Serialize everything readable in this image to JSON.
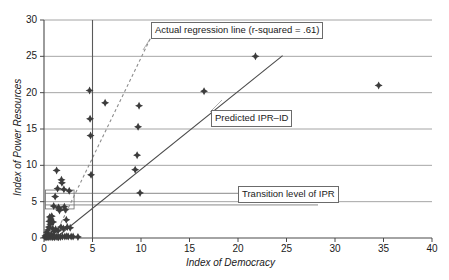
{
  "chart_data": {
    "type": "scatter",
    "title": "",
    "xlabel": "Index of Democracy",
    "ylabel": "Index of Power Resources",
    "xlim": [
      0,
      40
    ],
    "ylim": [
      0,
      30
    ],
    "xticks": [
      "0",
      "5",
      "10",
      "15",
      "20",
      "25",
      "30",
      "35",
      "40"
    ],
    "yticks": [
      "0",
      "5",
      "10",
      "15",
      "20",
      "25",
      "30"
    ],
    "grid": "horizontal",
    "legend_position": "none",
    "points": [
      [
        0.1,
        0.1
      ],
      [
        0.15,
        0.3
      ],
      [
        0.2,
        0.15
      ],
      [
        0.25,
        0.4
      ],
      [
        0.3,
        0.1
      ],
      [
        0.3,
        0.8
      ],
      [
        0.35,
        0.2
      ],
      [
        0.4,
        1.1
      ],
      [
        0.45,
        0.35
      ],
      [
        0.5,
        0.1
      ],
      [
        0.5,
        1.5
      ],
      [
        0.55,
        2.3
      ],
      [
        0.6,
        0.25
      ],
      [
        0.6,
        2.9
      ],
      [
        0.65,
        1.9
      ],
      [
        0.7,
        0.15
      ],
      [
        0.7,
        2.6
      ],
      [
        0.75,
        0.5
      ],
      [
        0.8,
        3.0
      ],
      [
        0.85,
        0.1
      ],
      [
        0.9,
        1.3
      ],
      [
        0.95,
        2.2
      ],
      [
        1.0,
        0.2
      ],
      [
        1.0,
        4.4
      ],
      [
        1.05,
        0.9
      ],
      [
        1.1,
        0.1
      ],
      [
        1.15,
        5.7
      ],
      [
        1.2,
        1.2
      ],
      [
        1.25,
        0.2
      ],
      [
        1.3,
        9.3
      ],
      [
        1.35,
        0.15
      ],
      [
        1.4,
        6.8
      ],
      [
        1.45,
        1.0
      ],
      [
        1.5,
        0.1
      ],
      [
        1.5,
        4.2
      ],
      [
        1.55,
        4.0
      ],
      [
        1.6,
        3.8
      ],
      [
        1.7,
        0.15
      ],
      [
        1.75,
        1.5
      ],
      [
        1.8,
        8.0
      ],
      [
        1.85,
        7.6
      ],
      [
        1.9,
        0.2
      ],
      [
        2.0,
        1.3
      ],
      [
        2.05,
        6.7
      ],
      [
        2.1,
        4.3
      ],
      [
        2.15,
        0.2
      ],
      [
        2.2,
        3.9
      ],
      [
        2.3,
        2.5
      ],
      [
        2.35,
        0.25
      ],
      [
        2.4,
        1.5
      ],
      [
        2.5,
        0.2
      ],
      [
        2.6,
        6.5
      ],
      [
        2.7,
        1.4
      ],
      [
        2.8,
        0.2
      ],
      [
        3.0,
        0.2
      ],
      [
        3.5,
        0.15
      ],
      [
        4.7,
        20.3
      ],
      [
        4.75,
        16.4
      ],
      [
        4.8,
        14.1
      ],
      [
        4.85,
        8.7
      ],
      [
        6.3,
        18.6
      ],
      [
        9.4,
        9.4
      ],
      [
        9.6,
        11.4
      ],
      [
        9.7,
        15.3
      ],
      [
        9.8,
        18.2
      ],
      [
        9.9,
        6.2
      ],
      [
        16.5,
        20.2
      ],
      [
        21.8,
        25.0
      ],
      [
        34.5,
        21.0
      ]
    ],
    "lines": [
      {
        "name": "actual-regression-line",
        "style": "dashed",
        "color": "#8c8c8c",
        "x0": 1.0,
        "y0": 0.0,
        "x1": 11.6,
        "y1": 29.2
      },
      {
        "name": "predicted-ipr-id-line",
        "style": "solid",
        "color": "#4a4a4a",
        "x0": 1.2,
        "y0": 0.0,
        "x1": 24.6,
        "y1": 25.1
      },
      {
        "name": "transition-level-vertical-line",
        "style": "solid",
        "color": "#5a5a5a",
        "x0": 5.0,
        "y0": 0.0,
        "x1": 5.0,
        "y1": 30.0
      }
    ],
    "annotations": [
      {
        "name": "actual-regression-annotation",
        "text": "Actual regression line (r-squared = .61)"
      },
      {
        "name": "predicted-ipr-annotation",
        "text": "Predicted IPR–ID"
      },
      {
        "name": "transition-level-annotation",
        "text": "Transition level of IPR"
      }
    ],
    "marker": {
      "color": "#3c3c3c",
      "shape": "diamond-star",
      "size": 4
    }
  }
}
